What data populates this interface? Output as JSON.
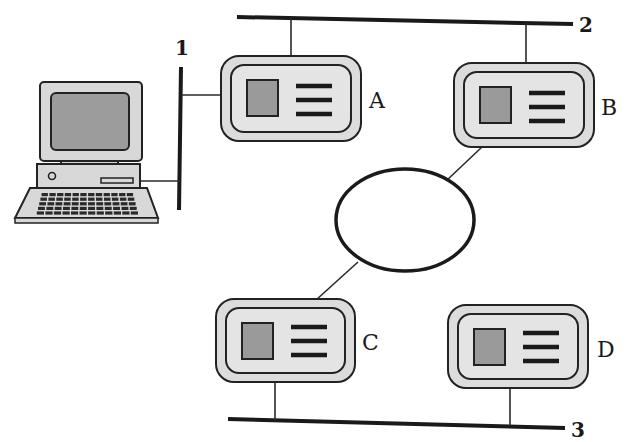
{
  "diagram": {
    "title": "",
    "buses": [
      {
        "id": "bus-1",
        "label": "1",
        "orientation": "vertical"
      },
      {
        "id": "bus-2",
        "label": "2",
        "orientation": "horizontal"
      },
      {
        "id": "bus-3",
        "label": "3",
        "orientation": "horizontal"
      }
    ],
    "ring": {
      "id": "ring",
      "label": ""
    },
    "devices": [
      {
        "id": "A",
        "label": "A",
        "connections": [
          "bus-1",
          "bus-2"
        ]
      },
      {
        "id": "B",
        "label": "B",
        "connections": [
          "bus-2",
          "ring"
        ]
      },
      {
        "id": "C",
        "label": "C",
        "connections": [
          "ring",
          "bus-3"
        ]
      },
      {
        "id": "D",
        "label": "D",
        "connections": [
          "bus-3"
        ]
      }
    ],
    "computer": {
      "id": "computer",
      "label": "",
      "connections": [
        "bus-1"
      ]
    },
    "colors": {
      "line": "#1a1a1a",
      "device_fill": "#dcdcdc",
      "screen_fill": "#9a9a9a",
      "background": "#ffffff"
    }
  }
}
